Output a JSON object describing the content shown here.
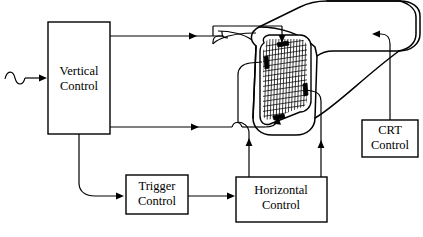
{
  "diagram": {
    "blocks": [
      {
        "id": "vertical",
        "name": "Vertical Control",
        "line1": "Vertical",
        "line2": "Control",
        "x": 48,
        "y": 22,
        "w": 62,
        "h": 112
      },
      {
        "id": "trigger",
        "name": "Trigger Control",
        "line1": "Trigger",
        "line2": "Control",
        "x": 126,
        "y": 175,
        "w": 62,
        "h": 39
      },
      {
        "id": "horizontal",
        "name": "Horizontal Control",
        "line1": "Horizontal",
        "line2": "Control",
        "x": 236,
        "y": 177,
        "w": 91,
        "h": 45
      },
      {
        "id": "crt",
        "name": "CRT Control",
        "line1": "CRT",
        "line2": "Control",
        "x": 362,
        "y": 120,
        "w": 56,
        "h": 37
      }
    ],
    "signal_source": {
      "name": "sine-wave-input",
      "label": ""
    },
    "crt_tube": {
      "name": "crt-tube",
      "screen_label": "",
      "plate_count": 4
    },
    "colors": {
      "stroke": "#000000",
      "background": "#ffffff"
    }
  }
}
